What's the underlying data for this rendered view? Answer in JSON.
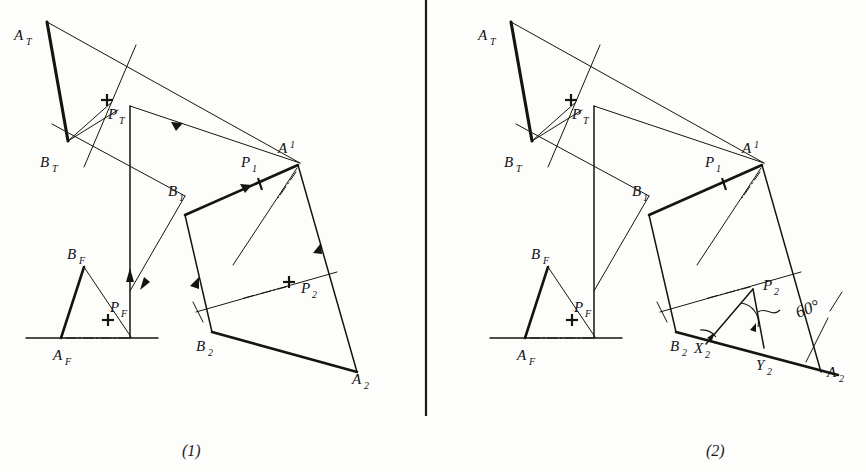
{
  "figure": {
    "title_absent": true,
    "panels": [
      {
        "id": "panel-1",
        "caption": "(1)",
        "labels": {
          "a_top": "A",
          "a_top_sub": "T",
          "b_top": "B",
          "b_top_sub": "T",
          "p_top": "P",
          "p_top_sub": "T",
          "a_front": "A",
          "a_front_sub": "F",
          "b_front": "B",
          "b_front_sub": "F",
          "p_front": "P",
          "p_front_sub": "F",
          "a_one": "A",
          "a_one_sub": "1",
          "b_one": "B",
          "b_one_sub": "1",
          "p_one": "P",
          "p_one_sub": "1",
          "a_two": "A",
          "a_two_sub": "2",
          "b_two": "B",
          "b_two_sub": "2",
          "p_two": "P",
          "p_two_sub": "2"
        }
      },
      {
        "id": "panel-2",
        "caption": "(2)",
        "labels": {
          "a_top": "A",
          "a_top_sub": "T",
          "b_top": "B",
          "b_top_sub": "T",
          "p_top": "P",
          "p_top_sub": "T",
          "a_front": "A",
          "a_front_sub": "F",
          "b_front": "B",
          "b_front_sub": "F",
          "p_front": "P",
          "p_front_sub": "F",
          "a_one": "A",
          "a_one_sub": "1",
          "b_one": "B",
          "b_one_sub": "1",
          "p_one": "P",
          "p_one_sub": "1",
          "a_two": "A",
          "a_two_sub": "2",
          "b_two": "B",
          "b_two_sub": "2",
          "p_two": "P",
          "p_two_sub": "2",
          "x_two": "X",
          "x_two_sub": "2",
          "y_two": "Y",
          "y_two_sub": "2",
          "angle": "60°"
        }
      }
    ],
    "bottom_cropped_text": "",
    "colors": {
      "ink": "#15150f",
      "paper": "#fdfdfc",
      "divider": "#1a1a18"
    }
  }
}
